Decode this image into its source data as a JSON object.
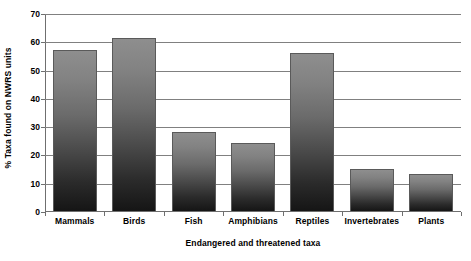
{
  "chart_data": {
    "type": "bar",
    "title": "",
    "xlabel": "Endangered and threatened taxa",
    "ylabel": "% Taxa found on NWRS units",
    "categories": [
      "Mammals",
      "Birds",
      "Fish",
      "Amphibians",
      "Reptiles",
      "Invertebrates",
      "Plants"
    ],
    "values": [
      57,
      61,
      28,
      24,
      56,
      15,
      13
    ],
    "ylim": [
      0,
      70
    ],
    "ytick_labels": [
      "0",
      "10",
      "20",
      "30",
      "40",
      "50",
      "60",
      "70"
    ],
    "ytick_values": [
      0,
      10,
      20,
      30,
      40,
      50,
      60,
      70
    ],
    "grid": "horizontal",
    "legend": "none",
    "bar_fill_top_color": "#8e8e8e",
    "bar_fill_bottom_color": "#151515",
    "bar_border_color": "#5a5a5a",
    "gridline_color": "#808080",
    "axis_color": "#6f6f6f",
    "background_color": "#ffffff"
  }
}
